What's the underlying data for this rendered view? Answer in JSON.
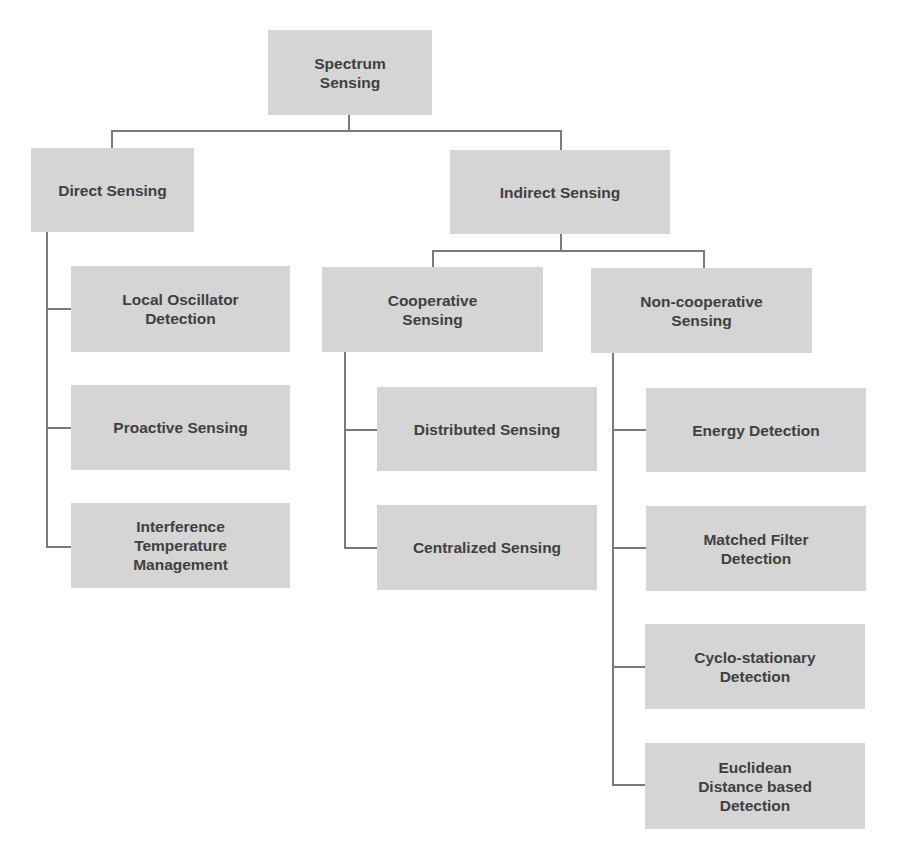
{
  "diagram": {
    "colors": {
      "box": "#d5d5d5",
      "text": "#404040",
      "line": "#7a7a7a"
    },
    "root": {
      "label": "Spectrum\nSensing"
    },
    "direct": {
      "label": "Direct Sensing",
      "children": [
        {
          "label": "Local Oscillator\nDetection"
        },
        {
          "label": "Proactive Sensing"
        },
        {
          "label": "Interference\nTemperature\nManagement"
        }
      ]
    },
    "indirect": {
      "label": "Indirect Sensing",
      "cooperative": {
        "label": "Cooperative\nSensing",
        "children": [
          {
            "label": "Distributed Sensing"
          },
          {
            "label": "Centralized Sensing"
          }
        ]
      },
      "noncooperative": {
        "label": "Non-cooperative\nSensing",
        "children": [
          {
            "label": "Energy Detection"
          },
          {
            "label": "Matched Filter\nDetection"
          },
          {
            "label": "Cyclo-stationary\nDetection"
          },
          {
            "label": "Euclidean\nDistance based\nDetection"
          }
        ]
      }
    }
  }
}
